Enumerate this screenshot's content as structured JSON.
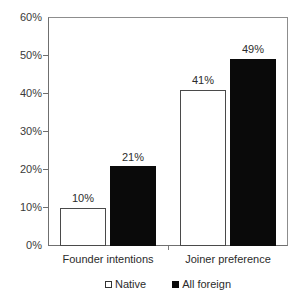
{
  "figure": {
    "cropped_text_above": "",
    "background_color": "#ffffff"
  },
  "chart_data": {
    "type": "bar",
    "title": "",
    "subtitle": "",
    "xlabel": "",
    "ylabel": "",
    "categories": [
      "Founder intentions",
      "Joiner preference"
    ],
    "series": [
      {
        "name": "Native",
        "values": [
          10,
          41
        ],
        "value_labels": [
          "10%",
          "41%"
        ],
        "fill_color": "#ffffff",
        "border_color": "#4a4a4a"
      },
      {
        "name": "All foreign",
        "values": [
          21,
          49
        ],
        "value_labels": [
          "21%",
          "49%"
        ],
        "fill_color": "#0a0a0a",
        "border_color": "#0a0a0a"
      }
    ],
    "ylim": [
      0,
      60
    ],
    "ytick_values": [
      0,
      10,
      20,
      30,
      40,
      50,
      60
    ],
    "ytick_labels": [
      "0%",
      "10%",
      "20%",
      "30%",
      "40%",
      "50%",
      "60%"
    ],
    "grid": false,
    "legend_position": "bottom-center",
    "value_labels_shown": true,
    "units": "percent"
  },
  "axis": {
    "y_labels": [
      "60%",
      "50%",
      "40%",
      "30%",
      "20%",
      "10%",
      "0%"
    ],
    "x_labels": [
      "Founder intentions",
      "Joiner preference"
    ]
  },
  "legend": {
    "items": [
      {
        "label": "Native",
        "marker": "open-square-marker"
      },
      {
        "label": "All foreign",
        "marker": "filled-square-marker"
      }
    ]
  },
  "labels": {
    "g0s0": "10%",
    "g0s1": "21%",
    "g1s0": "41%",
    "g1s1": "49%"
  }
}
